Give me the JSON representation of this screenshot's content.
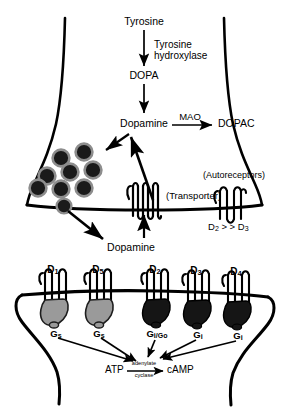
{
  "diagram": {
    "colors": {
      "stroke": "#000000",
      "background": "#ffffff",
      "vesicle_fill": "#1a1a1a",
      "vesicle_ring": "#8a8a8a",
      "g_protein_stimulatory": "#9a9a9a",
      "g_protein_inhibitory": "#151515"
    }
  },
  "synthesis_pathway": {
    "tyrosine": "Tyrosine",
    "enzyme_1_line_1": "Tyrosine",
    "enzyme_1_line_2": "hydroxylase",
    "dopa": "DOPA",
    "dopamine_cytoplasmic": "Dopamine",
    "metabolism_enzyme": "MAO",
    "metabolite": "DOPAC"
  },
  "presynaptic_terminal": {
    "vesicle_count": 9,
    "transporter_label": "(Transporter)",
    "autoreceptor_label": "(Autoreceptors)",
    "autoreceptor_subtypes": "D2 > > D3",
    "autoreceptor_subtype_a": "D",
    "autoreceptor_subtype_a_sub": "2",
    "autoreceptor_relation": " > > ",
    "autoreceptor_subtype_b": "D",
    "autoreceptor_subtype_b_sub": "3",
    "released_dopamine": "Dopamine"
  },
  "postsynaptic_cell": {
    "receptors": [
      {
        "name": "D",
        "subscript": "1",
        "g_protein": "G",
        "g_protein_sub": "s",
        "family": "D1-like",
        "effect": "stimulatory",
        "x": 53
      },
      {
        "name": "D",
        "subscript": "5",
        "g_protein": "G",
        "g_protein_sub": "s",
        "family": "D1-like",
        "effect": "stimulatory",
        "x": 98
      },
      {
        "name": "D",
        "subscript": "2",
        "g_protein": "G",
        "g_protein_sub": "i/Go",
        "family": "D2-like",
        "effect": "inhibitory",
        "x": 155
      },
      {
        "name": "D",
        "subscript": "3",
        "g_protein": "G",
        "g_protein_sub": "i",
        "family": "D2-like",
        "effect": "inhibitory",
        "x": 196
      },
      {
        "name": "D",
        "subscript": "4",
        "g_protein": "G",
        "g_protein_sub": "i",
        "family": "D2-like",
        "effect": "inhibitory",
        "x": 236
      }
    ],
    "g_protein_labels": [
      "Gs",
      "Gs",
      "Gi/Go",
      "Gi",
      "Gi"
    ],
    "second_messenger": {
      "substrate": "ATP",
      "enzyme_line_1": "adenylate",
      "enzyme_line_2": "cyclase",
      "product": "cAMP"
    }
  }
}
